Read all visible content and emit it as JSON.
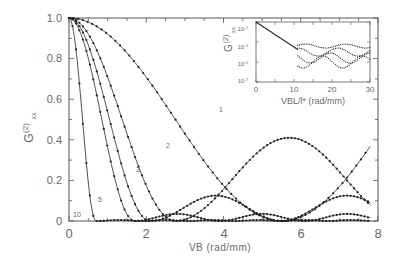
{
  "chart_data": [
    {
      "type": "line",
      "title": "",
      "xlabel": "VB (rad/mm)",
      "ylabel": "G(2)xx",
      "xlim": [
        0,
        8
      ],
      "ylim": [
        0,
        1.0
      ],
      "xticks": [
        "0",
        "2",
        "4",
        "6",
        "8"
      ],
      "yticks": [
        "0",
        "0.2",
        "0.4",
        "0.6",
        "0.8",
        "1.0"
      ],
      "grid": false,
      "markers": true,
      "series": [
        {
          "name": "1",
          "label_pos": [
            4.0,
            0.61
          ],
          "period_hint": "cos^2 envelope; zero near 5.5, peaks at 0 and ~8"
        },
        {
          "name": "2",
          "label_pos": [
            2.9,
            0.42
          ],
          "zero_near": 2.75,
          "secondary_peak": {
            "x": 5.7,
            "y": 0.41
          }
        },
        {
          "name": "3",
          "label_pos": [
            2.1,
            0.3
          ],
          "zero_near": 2.1,
          "secondary_peak": {
            "x": 3.8,
            "y": 0.125
          }
        },
        {
          "name": "5",
          "label_pos": [
            0.8,
            0.1
          ],
          "zero_near": 1.7
        },
        {
          "name": "10",
          "label_pos": [
            0.2,
            0.04
          ],
          "zero_near": 0.7
        }
      ],
      "samples": {
        "x": [
          0,
          0.5,
          1,
          1.5,
          2,
          2.5,
          3,
          3.5,
          4,
          4.5,
          5,
          5.5,
          6,
          6.5,
          7,
          7.5,
          7.8
        ],
        "s1": [
          1.0,
          0.99,
          0.97,
          0.93,
          0.87,
          0.79,
          0.68,
          0.55,
          0.41,
          0.26,
          0.12,
          0.01,
          0.02,
          0.11,
          0.27,
          0.43,
          0.53
        ],
        "s2": [
          1.0,
          0.95,
          0.83,
          0.63,
          0.4,
          0.16,
          0.01,
          0.06,
          0.22,
          0.34,
          0.4,
          0.41,
          0.39,
          0.31,
          0.17,
          0.05,
          0.01
        ],
        "s3": [
          1.0,
          0.86,
          0.58,
          0.27,
          0.05,
          0.0,
          0.04,
          0.1,
          0.12,
          0.09,
          0.03,
          0.0,
          0.03,
          0.08,
          0.11,
          0.12,
          0.1
        ],
        "s5": [
          1.0,
          0.72,
          0.3,
          0.05,
          0.0,
          0.02,
          0.03,
          0.02,
          0.01,
          0.0,
          0.01,
          0.02,
          0.02,
          0.01,
          0.0,
          0.01,
          0.02
        ],
        "s10": [
          1.0,
          0.18,
          0.0,
          0.01,
          0.0,
          0.0,
          0.0,
          0.0,
          0.0,
          0.0,
          0.0,
          0.0,
          0.0,
          0.0,
          0.0,
          0.0,
          0.0
        ]
      }
    },
    {
      "type": "scatter",
      "title": "inset",
      "xlabel": "VBL/l* (rad/mm)",
      "ylabel": "G(2)xx",
      "xlim": [
        0,
        30
      ],
      "ylim_log": [
        "10^-7",
        "10^-1"
      ],
      "xticks": [
        "0",
        "10",
        "20",
        "30"
      ],
      "yticks": [
        "10^-1",
        "10^-3",
        "10^-5",
        "10^-7"
      ],
      "yscale": "log",
      "description": "All curves collapse onto a single decay from ~1 at 0 to ~10^-3.5 at ~11, then scatter between 10^-3 and 10^-6 up to 30"
    }
  ],
  "labels": {
    "xlabel": "VB (rad/mm)",
    "ylabel_main": "G",
    "ylabel_sup": "(2)",
    "ylabel_sub": "xx",
    "inset_xlabel": "VBL/l* (rad/mm)",
    "inset_ylabel_main": "G",
    "inset_ylabel_sup": "(2)",
    "inset_ylabel_sub": "xx",
    "curve_1": "1",
    "curve_2": "2",
    "curve_3": "3",
    "curve_5": "5",
    "curve_10": "10",
    "xt0": "0",
    "xt2": "2",
    "xt4": "4",
    "xt6": "6",
    "xt8": "8",
    "yt0": "0",
    "yt02": "0.2",
    "yt04": "0.4",
    "yt06": "0.6",
    "yt08": "0.8",
    "yt10": "1.0",
    "ixt0": "0",
    "ixt10": "10",
    "ixt20": "20",
    "ixt30": "30",
    "iyt1": "10",
    "iyt1e": "-1",
    "iyt3": "10",
    "iyt3e": "-3",
    "iyt5": "10",
    "iyt5e": "-5",
    "iyt7": "10",
    "iyt7e": "-7"
  },
  "colors": {
    "axis": "#555555",
    "curve": "#222222",
    "text": "#6a6a6a",
    "background": "#ffffff"
  }
}
